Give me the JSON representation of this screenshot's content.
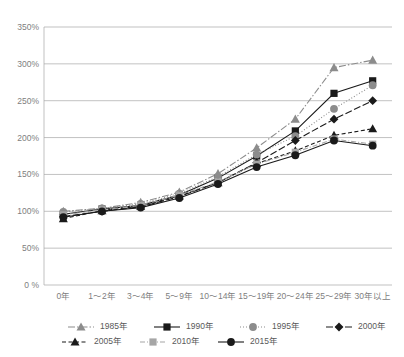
{
  "chart_data": {
    "type": "line",
    "title": "",
    "xlabel": "",
    "ylabel": "",
    "ylim": [
      0,
      350
    ],
    "yticks": [
      0,
      50,
      100,
      150,
      200,
      250,
      300,
      350
    ],
    "ytick_labels": [
      "0 %",
      "50%",
      "100%",
      "150%",
      "200%",
      "250%",
      "300%",
      "350%"
    ],
    "grid": true,
    "legend_position": "bottom",
    "categories": [
      "0年",
      "1～2年",
      "3～4年",
      "5～9年",
      "10～14年",
      "15～19年",
      "20～24年",
      "25～29年",
      "30年以上"
    ],
    "series": [
      {
        "name": "1985年",
        "marker": "triangle",
        "color": "#8c8c8c",
        "line_style": "dash-dot",
        "values": [
          100,
          104,
          112,
          126,
          151,
          186,
          225,
          295,
          305
        ]
      },
      {
        "name": "1990年",
        "marker": "square",
        "color": "#1a1a1a",
        "line_style": "solid",
        "values": [
          96,
          103,
          108,
          122,
          145,
          175,
          209,
          260,
          277
        ]
      },
      {
        "name": "1995年",
        "marker": "circle",
        "color": "#8c8c8c",
        "line_style": "dotted",
        "values": [
          99,
          104,
          110,
          124,
          147,
          177,
          202,
          239,
          271
        ]
      },
      {
        "name": "2000年",
        "marker": "diamond",
        "color": "#1a1a1a",
        "line_style": "long-dash",
        "values": [
          93,
          100,
          106,
          120,
          139,
          166,
          196,
          225,
          250
        ]
      },
      {
        "name": "2005年",
        "marker": "triangle",
        "color": "#1a1a1a",
        "line_style": "dashed",
        "values": [
          90,
          101,
          107,
          121,
          139,
          165,
          182,
          203,
          212
        ]
      },
      {
        "name": "2010年",
        "marker": "square",
        "color": "#a6a6a6",
        "line_style": "dash-dot-thin",
        "values": [
          95,
          102,
          108,
          122,
          140,
          164,
          180,
          198,
          191
        ]
      },
      {
        "name": "2015年",
        "marker": "circle",
        "color": "#1a1a1a",
        "line_style": "solid",
        "values": [
          92,
          100,
          105,
          118,
          137,
          160,
          176,
          196,
          189
        ]
      }
    ]
  },
  "legend": {
    "rows": [
      [
        "1985年",
        "1990年",
        "1995年",
        "2000年"
      ],
      [
        "2005年",
        "2010年",
        "2015年"
      ]
    ]
  },
  "colors": {
    "grid": "#a6a6a6",
    "tick_text": "#808080",
    "legend_text": "#595959",
    "dark": "#1a1a1a",
    "mid_gray": "#8c8c8c",
    "light_gray": "#a6a6a6"
  }
}
